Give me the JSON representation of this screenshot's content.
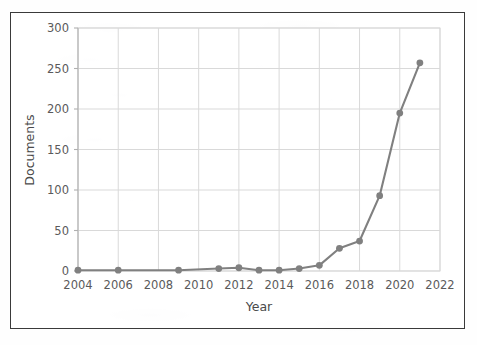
{
  "chart_data": {
    "type": "line",
    "title": "",
    "xlabel": "Year",
    "ylabel": "Documents",
    "xlim": [
      2004,
      2022
    ],
    "ylim": [
      0,
      300
    ],
    "xticks": [
      2004,
      2006,
      2008,
      2010,
      2012,
      2014,
      2016,
      2018,
      2020,
      2022
    ],
    "yticks": [
      0,
      50,
      100,
      150,
      200,
      250,
      300
    ],
    "xtick_labels": [
      "2004",
      "2006",
      "2008",
      "2010",
      "2012",
      "2014",
      "2016",
      "2018",
      "2020",
      "2022"
    ],
    "ytick_labels": [
      "0",
      "50",
      "100",
      "150",
      "200",
      "250",
      "300"
    ],
    "grid": true,
    "legend": false,
    "legend_position": "none",
    "marker": "circle",
    "series": [
      {
        "name": "Documents",
        "color": "#808080",
        "x": [
          2004,
          2006,
          2009,
          2011,
          2012,
          2013,
          2014,
          2015,
          2016,
          2017,
          2018,
          2019,
          2020,
          2021
        ],
        "values": [
          1,
          1,
          1,
          3,
          4,
          1,
          1,
          3,
          7,
          28,
          37,
          93,
          195,
          257
        ]
      }
    ]
  },
  "style": {
    "line_color": "#808080",
    "marker_color": "#808080",
    "grid_color": "#d9d9d9",
    "axis_color": "#b0b0b0",
    "frame_color": "#3a3a3a",
    "text_color": "#5a5a5a",
    "background": "#fefefe"
  }
}
